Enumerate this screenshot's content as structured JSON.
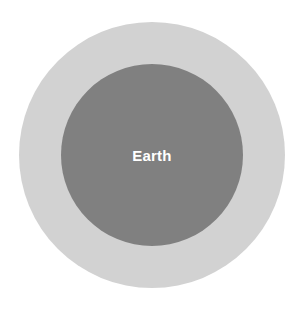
{
  "figure": {
    "background_color": "#ffffff",
    "width": 307,
    "height": 309
  },
  "chart_data": {
    "type": "pie",
    "title": "",
    "subtitle": "",
    "xlabel": "",
    "ylabel": "",
    "grid": false,
    "legend_position": "none",
    "categories": [
      "outer circle",
      "inner circle"
    ],
    "values": [
      266,
      182
    ],
    "series": [
      {
        "name": "circle diameter (px)",
        "values": [
          266,
          182
        ]
      }
    ],
    "annotations": [
      {
        "text": "Earth",
        "target": "inner circle",
        "color": "#ffffff",
        "position": "center"
      }
    ],
    "shapes": [
      {
        "id": "outer",
        "shape": "circle",
        "label": "",
        "fill": "#d2d2d2",
        "center_x": 152,
        "center_y": 155,
        "diameter": 266,
        "radius": 133
      },
      {
        "id": "inner",
        "shape": "circle",
        "label": "Earth",
        "fill": "#808080",
        "center_x": 152,
        "center_y": 155,
        "diameter": 182,
        "radius": 91
      }
    ]
  },
  "outer_circle": {
    "label": "",
    "color": "#d2d2d2"
  },
  "inner_circle": {
    "label": "Earth",
    "color": "#808080",
    "label_color": "#ffffff"
  }
}
